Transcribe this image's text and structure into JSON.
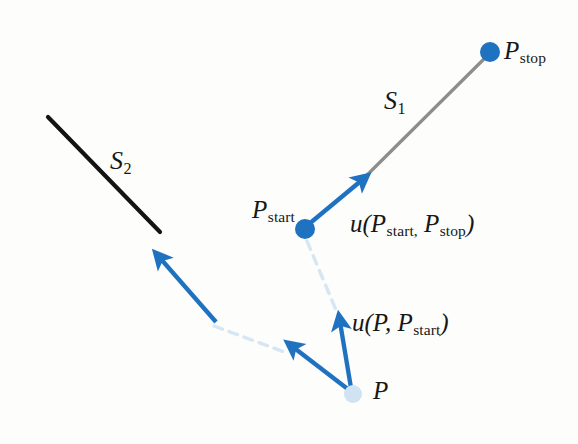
{
  "figure": {
    "background_color": "#fdfdfb",
    "width": 578,
    "height": 444
  },
  "colors": {
    "blue": "#1f72c0",
    "blue_dark": "#1a66b3",
    "gray_segment": "#8d8d8d",
    "black_segment": "#141414",
    "pale_blue": "#d6e6f2",
    "pale_dot": "#cfe3f2",
    "text": "#171717"
  },
  "labels": {
    "p_stop": {
      "base": "P",
      "sub": "stop"
    },
    "p_start": {
      "base": "P",
      "sub": "start"
    },
    "p": {
      "base": "P",
      "sub": ""
    },
    "s1": {
      "base": "S",
      "sub": "1"
    },
    "s2": {
      "base": "S",
      "sub": "2"
    },
    "u_start_stop": {
      "fn": "u",
      "open": "(",
      "arg1_base": "P",
      "arg1_sub": "start",
      "sep": ",",
      "arg2_base": "P",
      "arg2_sub": "stop",
      "close": ")"
    },
    "u_p_start": {
      "fn": "u",
      "open": "(",
      "arg1_base": "P",
      "arg1_sub": "",
      "sep": ",",
      "arg2_base": "P",
      "arg2_sub": "start",
      "close": ")"
    }
  },
  "geometry": {
    "points": {
      "p_stop": {
        "x": 490,
        "y": 52,
        "r": 10,
        "fill": "#1f72c0",
        "kind": "solid-dot"
      },
      "p_start": {
        "x": 305,
        "y": 229,
        "r": 10,
        "fill": "#1f72c0",
        "kind": "solid-dot"
      },
      "p": {
        "x": 353,
        "y": 394,
        "r": 9,
        "fill": "#cfe3f2",
        "kind": "pale-dot"
      }
    },
    "segments": [
      {
        "name": "S1",
        "x1": 360,
        "y1": 182,
        "x2": 488,
        "y2": 55,
        "color": "#8d8d8d",
        "width": 3.2,
        "style": "solid"
      },
      {
        "name": "S2",
        "x1": 48,
        "y1": 117,
        "x2": 160,
        "y2": 232,
        "color": "#141414",
        "width": 4.2,
        "style": "solid"
      }
    ],
    "arrows": [
      {
        "name": "u-start-stop",
        "x1": 309,
        "y1": 224,
        "x2": 366,
        "y2": 176,
        "color": "#1f72c0",
        "width": 4.4
      },
      {
        "name": "u-toward-s2",
        "x1": 215,
        "y1": 320,
        "x2": 157,
        "y2": 254,
        "color": "#1f72c0",
        "width": 4.4
      },
      {
        "name": "u-p-start",
        "x1": 351,
        "y1": 388,
        "x2": 339,
        "y2": 316,
        "color": "#1f72c0",
        "width": 4.4
      },
      {
        "name": "u-p-to-s2",
        "x1": 349,
        "y1": 390,
        "x2": 289,
        "y2": 343,
        "color": "#1f72c0",
        "width": 4.4
      }
    ],
    "dashed": [
      {
        "name": "pstart-to-p-guide",
        "x1": 307,
        "y1": 240,
        "x2": 345,
        "y2": 330,
        "color": "#d6e6f2",
        "width": 3.4,
        "dash": "9 7"
      },
      {
        "name": "s2-extension-guide",
        "x1": 213,
        "y1": 325,
        "x2": 286,
        "y2": 352,
        "color": "#d6e6f2",
        "width": 3.4,
        "dash": "9 7"
      }
    ]
  }
}
